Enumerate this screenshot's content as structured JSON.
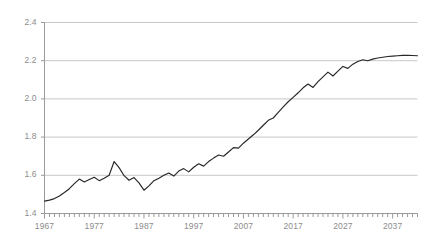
{
  "chart_data": {
    "type": "line",
    "title": "",
    "subtitle": "",
    "xlabel": "",
    "ylabel": "",
    "xlim": [
      1967,
      2042
    ],
    "ylim": [
      1.4,
      2.4
    ],
    "yticks": [
      "1.4",
      "1.6",
      "1.8",
      "2.0",
      "2.2",
      "2.4"
    ],
    "ytick_values": [
      1.4,
      1.6,
      1.8,
      2.0,
      2.2,
      2.4
    ],
    "xticks": [
      "1967",
      "1977",
      "1987",
      "1997",
      "2007",
      "2017",
      "2027",
      "2037"
    ],
    "xtick_values": [
      1967,
      1977,
      1987,
      1997,
      2007,
      2017,
      2027,
      2037
    ],
    "minor_xtick_interval": 1,
    "grid": "horizontal",
    "legend": "none",
    "line_color": "#262626",
    "grid_color": "#c8c8c8",
    "axis_color": "#9a9a9a",
    "label_color": "#8c8c8c",
    "background": "#ffffff",
    "series": [
      {
        "name": "series-1",
        "x": [
          1967,
          1968,
          1969,
          1970,
          1971,
          1972,
          1973,
          1974,
          1975,
          1976,
          1977,
          1978,
          1979,
          1980,
          1981,
          1982,
          1983,
          1984,
          1985,
          1986,
          1987,
          1988,
          1989,
          1990,
          1991,
          1992,
          1993,
          1994,
          1995,
          1996,
          1997,
          1998,
          1999,
          2000,
          2001,
          2002,
          2003,
          2004,
          2005,
          2006,
          2007,
          2008,
          2009,
          2010,
          2011,
          2012,
          2013,
          2014,
          2015,
          2016,
          2017,
          2018,
          2019,
          2020,
          2021,
          2022,
          2023,
          2024,
          2025,
          2026,
          2027,
          2028,
          2029,
          2030,
          2031,
          2032,
          2033,
          2034,
          2035,
          2036,
          2037,
          2038,
          2039,
          2040,
          2041,
          2042
        ],
        "values": [
          1.465,
          1.47,
          1.478,
          1.492,
          1.51,
          1.53,
          1.556,
          1.58,
          1.565,
          1.578,
          1.59,
          1.572,
          1.585,
          1.6,
          1.672,
          1.64,
          1.598,
          1.574,
          1.588,
          1.56,
          1.522,
          1.545,
          1.572,
          1.585,
          1.6,
          1.612,
          1.596,
          1.622,
          1.635,
          1.618,
          1.642,
          1.66,
          1.648,
          1.672,
          1.69,
          1.706,
          1.7,
          1.722,
          1.745,
          1.742,
          1.768,
          1.79,
          1.812,
          1.836,
          1.862,
          1.888,
          1.9,
          1.93,
          1.958,
          1.985,
          2.008,
          2.032,
          2.058,
          2.078,
          2.06,
          2.09,
          2.115,
          2.14,
          2.12,
          2.145,
          2.17,
          2.16,
          2.182,
          2.196,
          2.205,
          2.2,
          2.208,
          2.214,
          2.218,
          2.222,
          2.224,
          2.226,
          2.228,
          2.228,
          2.227,
          2.226
        ]
      }
    ],
    "note_shape": "rising S-curve flattening after 2017 with slight terminal upturn"
  },
  "axis": {
    "y_labels": [
      "2.4",
      "2.2",
      "2.0",
      "1.8",
      "1.6",
      "1.4"
    ],
    "x_labels": [
      "1967",
      "1977",
      "1987",
      "1997",
      "2007",
      "2017",
      "2027",
      "2037"
    ]
  }
}
